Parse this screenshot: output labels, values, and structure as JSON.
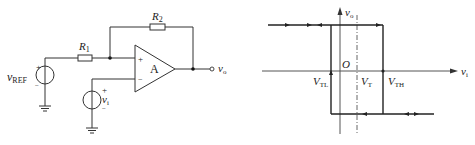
{
  "circuit": {
    "resistor_feedback": {
      "label": "R",
      "sub": "2"
    },
    "resistor_input": {
      "label": "R",
      "sub": "1"
    },
    "opamp": {
      "label": "A",
      "plus": "+",
      "minus": "−"
    },
    "source_ref": {
      "label": "v",
      "sub": "REF",
      "plus": "+",
      "minus": "−"
    },
    "source_in": {
      "label": "v",
      "sub": "i",
      "plus": "+",
      "minus": "−"
    },
    "output": {
      "label": "v",
      "sub": "o"
    }
  },
  "graph": {
    "y_axis": {
      "label": "v",
      "sub": "o"
    },
    "x_axis": {
      "label": "v",
      "sub": "i"
    },
    "origin": "O",
    "thresholds": {
      "low": {
        "label": "V",
        "sub": "TL"
      },
      "center": {
        "label": "V",
        "sub": "T"
      },
      "high": {
        "label": "V",
        "sub": "TH"
      }
    },
    "colors": {
      "line": "#222222",
      "axis": "#555555"
    }
  }
}
